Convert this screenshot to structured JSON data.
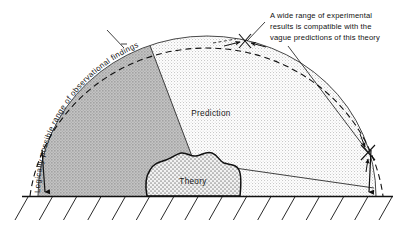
{
  "figure": {
    "background_color": "#ffffff",
    "ink_color": "#111111"
  },
  "regions": {
    "outer_arc": {
      "label": "Logically possible range of observational findings",
      "style": "dashed arc",
      "color": "#111111"
    },
    "prediction": {
      "label": "Prediction",
      "fill_color": "#e9e9e9",
      "pattern": "fine light stipple"
    },
    "possible_not_predicted": {
      "fill_color": "#b4b4b4",
      "pattern": "medium gray stipple"
    },
    "theory": {
      "label": "Theory",
      "fill_color": "#dedede",
      "pattern": "coarse dotted / cross-stipple",
      "outline": "irregular bold blob"
    }
  },
  "annotation": {
    "lines": [
      "A wide range of experimental",
      "results is compatible with the",
      "vague predictions of this theory"
    ],
    "leader_count": 2,
    "marker": "x-cross"
  },
  "markers": {
    "top_cross": "x-marker-top",
    "right_cross": "x-marker-right",
    "left_arrow": "range-arrow-left",
    "right_arrow": "range-arrow-right"
  },
  "baseline": {
    "name": "ground-line",
    "hatch_count": 16,
    "hatch_direction": "down-left"
  }
}
